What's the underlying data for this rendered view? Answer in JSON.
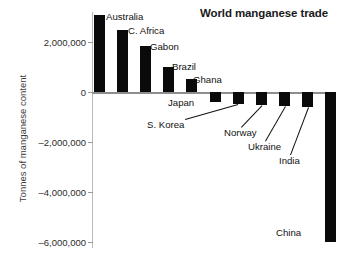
{
  "chart_data": {
    "type": "bar",
    "title": "World manganese trade",
    "xlabel": "",
    "ylabel": "Tonnes of manganese content",
    "ylim": [
      -6000000,
      3200000
    ],
    "yticks": [
      2000000,
      0,
      -2000000,
      -4000000,
      -6000000
    ],
    "ytick_labels": [
      "2,000,000",
      "0",
      "–2,000,000",
      "–4,000,000",
      "–6,000,000"
    ],
    "grid": false,
    "legend": "none",
    "bar_color": "#0a0a0a",
    "categories": [
      "Australia",
      "C. Africa",
      "Gabon",
      "Brazil",
      "Ghana",
      "Japan",
      "S. Korea",
      "Norway",
      "Ukraine",
      "India",
      "China"
    ],
    "values": [
      3100000,
      2500000,
      1860000,
      1020000,
      540000,
      -400000,
      -460000,
      -510000,
      -570000,
      -610000,
      -5980000
    ],
    "bars": [
      {
        "name": "Australia",
        "value": 3100000,
        "label": "Australia",
        "label_x": 106,
        "label_y": 12,
        "leader": false
      },
      {
        "name": "C. Africa",
        "value": 2500000,
        "label": "C. Africa",
        "label_x": 128,
        "label_y": 26,
        "leader": false
      },
      {
        "name": "Gabon",
        "value": 1860000,
        "label": "Gabon",
        "label_x": 150,
        "label_y": 42,
        "leader": false
      },
      {
        "name": "Brazil",
        "value": 1020000,
        "label": "Brazil",
        "label_x": 172,
        "label_y": 62,
        "leader": false
      },
      {
        "name": "Ghana",
        "value": 540000,
        "label": "Ghana",
        "label_x": 193,
        "label_y": 75,
        "leader": false
      },
      {
        "name": "Japan",
        "value": -400000,
        "label": "Japan",
        "label_x": 168,
        "label_y": 98,
        "leader": false
      },
      {
        "name": "S. Korea",
        "value": -460000,
        "label": "S. Korea",
        "label_x": 147,
        "label_y": 120,
        "leader": true
      },
      {
        "name": "Norway",
        "value": -510000,
        "label": "Norway",
        "label_x": 224,
        "label_y": 128,
        "leader": true
      },
      {
        "name": "Ukraine",
        "value": -570000,
        "label": "Ukraine",
        "label_x": 248,
        "label_y": 142,
        "leader": true
      },
      {
        "name": "India",
        "value": -610000,
        "label": "India",
        "label_x": 279,
        "label_y": 156,
        "leader": true
      },
      {
        "name": "China",
        "value": -5980000,
        "label": "China",
        "label_x": 276,
        "label_y": 228,
        "leader": false
      }
    ]
  }
}
